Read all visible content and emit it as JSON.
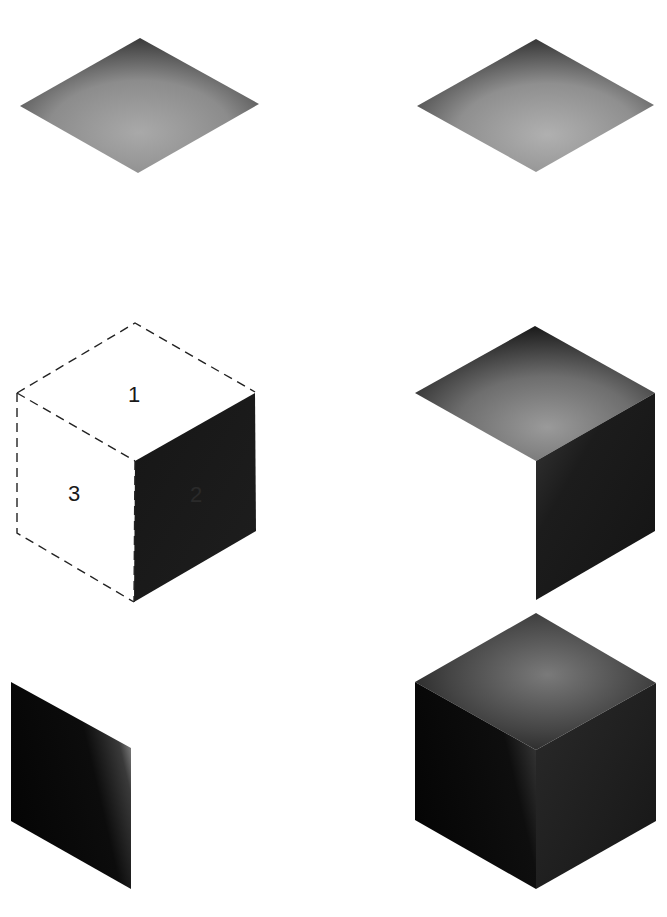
{
  "figure": {
    "panels": [
      {
        "id": "top-face-shading-1",
        "label": ""
      },
      {
        "id": "top-face-shading-2",
        "label": ""
      },
      {
        "id": "numbered-cube-diagram",
        "faces": [
          {
            "number": "1",
            "face": "top"
          },
          {
            "number": "2",
            "face": "right"
          },
          {
            "number": "3",
            "face": "left"
          }
        ]
      },
      {
        "id": "top-and-right-faces",
        "label": ""
      },
      {
        "id": "left-face-only",
        "label": ""
      },
      {
        "id": "fully-shaded-cube",
        "label": ""
      }
    ],
    "colors": {
      "background": "#ffffff",
      "dark_face": "#111111",
      "mid_gray": "#8a8a8a",
      "light_gray": "#a8a8a8",
      "dash_line": "#222222"
    }
  }
}
